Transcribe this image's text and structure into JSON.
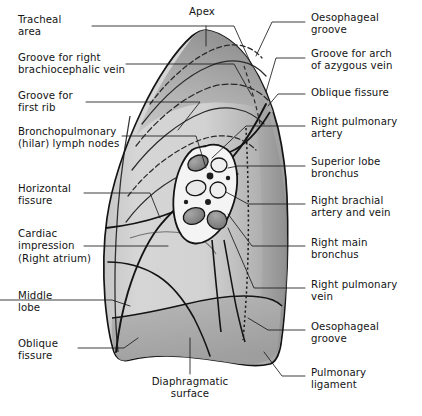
{
  "figure": {
    "background_color": "#ffffff",
    "ink_color": "#141414",
    "lung_fill_light": "#d3d3d3",
    "lung_fill_mid": "#bfbfbf",
    "lung_fill_dark": "#a3a3a3",
    "lung_fill_darker": "#8e8e8e",
    "hilum_fill": "#f2f2f2",
    "vessel_fill": "#8a8a8a",
    "node_fill": "#1d1d1d"
  },
  "labels": {
    "apex": "Apex",
    "tracheal_area": "Tracheal\narea",
    "groove_brachiocephalic": "Groove for right\nbrachiocephalic vein",
    "groove_first_rib": "Groove for\nfirst rib",
    "bronchopulmonary_nodes": "Bronchopulmonary\n(hilar) lymph nodes",
    "horizontal_fissure": "Horizontal\nfissure",
    "cardiac_impression": "Cardiac\nimpression\n(Right atrium)",
    "middle_lobe": "Middle\nlobe",
    "oblique_fissure_left": "Oblique\nfissure",
    "diaphragmatic_surface": "Diaphragmatic\nsurface",
    "oesophageal_groove_top": "Oesophageal\ngroove",
    "groove_azygous": "Groove for arch\nof azygous vein",
    "oblique_fissure_right": "Oblique fissure",
    "right_pulmonary_artery": "Right pulmonary\nartery",
    "superior_lobe_bronchus": "Superior lobe\nbronchus",
    "right_brachial": "Right brachial\nartery and vein",
    "right_main_bronchus": "Right main\nbronchus",
    "right_pulmonary_vein": "Right pulmonary\nvein",
    "oesophageal_groove_bottom": "Oesophageal\ngroove",
    "pulmonary_ligament": "Pulmonary\nligament"
  },
  "label_positions": {
    "apex": {
      "x": 192,
      "y": 8,
      "align": "center"
    },
    "tracheal_area": {
      "x": 18,
      "y": 14,
      "align": "left"
    },
    "groove_brachiocephalic": {
      "x": 18,
      "y": 54,
      "align": "left"
    },
    "groove_first_rib": {
      "x": 18,
      "y": 92,
      "align": "left"
    },
    "bronchopulmonary_nodes": {
      "x": 18,
      "y": 128,
      "align": "left"
    },
    "horizontal_fissure": {
      "x": 18,
      "y": 185,
      "align": "left"
    },
    "cardiac_impression": {
      "x": 18,
      "y": 232,
      "align": "left"
    },
    "middle_lobe": {
      "x": 18,
      "y": 292,
      "align": "left"
    },
    "oblique_fissure_left": {
      "x": 18,
      "y": 340,
      "align": "left"
    },
    "diaphragmatic_surface": {
      "x": 148,
      "y": 378,
      "align": "center"
    },
    "oesophageal_groove_top": {
      "x": 311,
      "y": 14,
      "align": "left"
    },
    "groove_azygous": {
      "x": 311,
      "y": 50,
      "align": "left"
    },
    "oblique_fissure_right": {
      "x": 311,
      "y": 88,
      "align": "left"
    },
    "right_pulmonary_artery": {
      "x": 311,
      "y": 118,
      "align": "left"
    },
    "superior_lobe_bronchus": {
      "x": 311,
      "y": 158,
      "align": "left"
    },
    "right_brachial": {
      "x": 311,
      "y": 196,
      "align": "left"
    },
    "right_main_bronchus": {
      "x": 311,
      "y": 238,
      "align": "left"
    },
    "right_pulmonary_vein": {
      "x": 311,
      "y": 280,
      "align": "left"
    },
    "oesophageal_groove_bottom": {
      "x": 311,
      "y": 322,
      "align": "left"
    },
    "pulmonary_ligament": {
      "x": 311,
      "y": 368,
      "align": "left"
    }
  },
  "anatomy_parts": [
    "apex",
    "costal-surface",
    "mediastinal-surface",
    "diaphragmatic-surface",
    "hilum",
    "oblique-fissure",
    "horizontal-fissure",
    "pulmonary-ligament",
    "rib-grooves",
    "azygos-groove",
    "oesophageal-groove"
  ]
}
